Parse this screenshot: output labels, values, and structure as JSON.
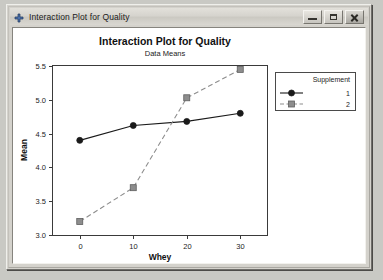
{
  "window": {
    "title": "Interaction Plot for Quality",
    "icon": "crosshair-plus-icon",
    "controls": {
      "minimize_label": "Minimize",
      "maximize_label": "Maximize",
      "close_label": "Close"
    }
  },
  "chart_data": {
    "type": "line",
    "title": "Interaction Plot for Quality",
    "subtitle": "Data Means",
    "xlabel": "Whey",
    "ylabel": "Mean",
    "x": [
      0,
      10,
      20,
      30
    ],
    "xticklabels": [
      "0",
      "10",
      "20",
      "30"
    ],
    "yticklabels": [
      "3.0",
      "3.5",
      "4.0",
      "4.5",
      "5.0",
      "5.5"
    ],
    "yticks": [
      3.0,
      3.5,
      4.0,
      4.5,
      5.0,
      5.5
    ],
    "xlim": [
      -5,
      35
    ],
    "ylim": [
      3.0,
      5.5
    ],
    "grid": false,
    "legend": {
      "title": "Supplement",
      "position": "right-top",
      "entries": [
        {
          "label": "1",
          "marker": "circle",
          "line": "solid",
          "color": "#1a1a1a"
        },
        {
          "label": "2",
          "marker": "square",
          "line": "dashed",
          "color": "#8d8d8d"
        }
      ]
    },
    "series": [
      {
        "name": "1",
        "marker": "circle",
        "line": "solid",
        "color": "#1a1a1a",
        "values": [
          4.4,
          4.62,
          4.68,
          4.8
        ]
      },
      {
        "name": "2",
        "marker": "square",
        "line": "dashed",
        "color": "#8d8d8d",
        "values": [
          3.2,
          3.7,
          5.03,
          5.45
        ]
      }
    ]
  }
}
